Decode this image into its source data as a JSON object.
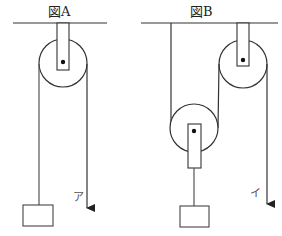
{
  "figures": {
    "a": {
      "title": "図A",
      "arrow_label": "ア",
      "type": "fixed pulley"
    },
    "b": {
      "title": "図B",
      "arrow_label": "イ",
      "type": "fixed pulley + movable pulley"
    }
  },
  "colors": {
    "stroke": "#333333",
    "rope": "#444444",
    "background": "#ffffff"
  }
}
